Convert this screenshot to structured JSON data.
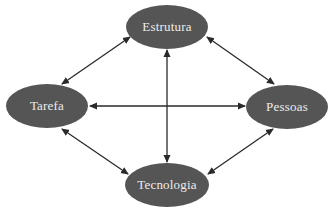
{
  "diagram": {
    "colors": {
      "node_fill": "#555555",
      "node_text": "#ececec",
      "arrow": "#2a2a2a",
      "background": "#ffffff"
    },
    "nodes": [
      {
        "id": "estrutura",
        "label": "Estrutura",
        "cx": 167,
        "cy": 27,
        "rx": 41,
        "ry": 22
      },
      {
        "id": "tarefa",
        "label": "Tarefa",
        "cx": 47,
        "cy": 106,
        "rx": 41,
        "ry": 22
      },
      {
        "id": "pessoas",
        "label": "Pessoas",
        "cx": 287,
        "cy": 107,
        "rx": 41,
        "ry": 22
      },
      {
        "id": "tecnologia",
        "label": "Tecnologia",
        "cx": 167,
        "cy": 185,
        "rx": 42,
        "ry": 22
      }
    ],
    "edges": [
      {
        "from": "estrutura",
        "to": "tarefa",
        "type": "bidirectional"
      },
      {
        "from": "estrutura",
        "to": "pessoas",
        "type": "bidirectional"
      },
      {
        "from": "estrutura",
        "to": "tecnologia",
        "type": "bidirectional"
      },
      {
        "from": "tarefa",
        "to": "pessoas",
        "type": "bidirectional"
      },
      {
        "from": "tarefa",
        "to": "tecnologia",
        "type": "bidirectional"
      },
      {
        "from": "pessoas",
        "to": "tecnologia",
        "type": "bidirectional"
      }
    ]
  }
}
